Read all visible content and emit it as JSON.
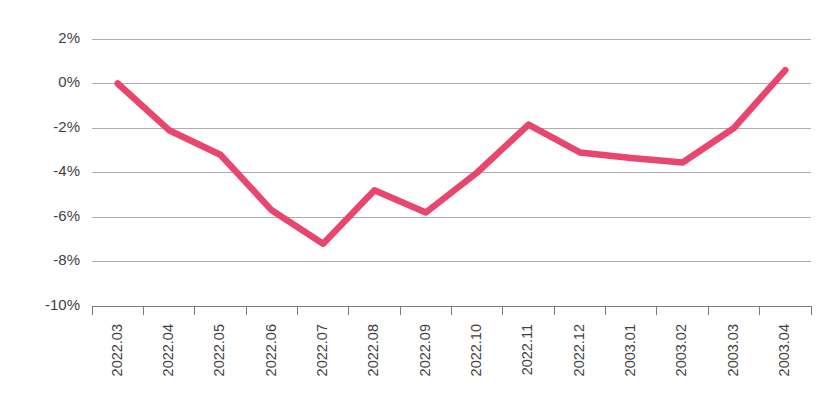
{
  "chart_data": {
    "type": "line",
    "title": "",
    "subtitle": "",
    "xlabel": "",
    "ylabel": "",
    "grid": true,
    "legend": false,
    "legend_position": "none",
    "ylim": [
      -10,
      2
    ],
    "ytick_values": [
      2,
      0,
      -2,
      -4,
      -6,
      -8,
      -10
    ],
    "ytick_labels": [
      "2%",
      "0%",
      "-2%",
      "-4%",
      "-6%",
      "-8%",
      "-10%"
    ],
    "categories": [
      "2022.03",
      "2022.04",
      "2022.05",
      "2022.06",
      "2022.07",
      "2022.08",
      "2022.09",
      "2022.10",
      "2022.11",
      "2022.12",
      "2003.01",
      "2003.02",
      "2003.03",
      "2003.04"
    ],
    "series": [
      {
        "name": "series-1",
        "color": "#E8466F",
        "values": [
          0.0,
          -2.1,
          -3.2,
          -5.7,
          -7.2,
          -4.8,
          -5.8,
          -4.0,
          -1.85,
          -3.1,
          -3.35,
          -3.55,
          -2.0,
          0.6
        ]
      }
    ]
  },
  "style": {
    "line_color": "#E8466F",
    "grid_color": "#8c8c8c",
    "axis_color": "#6e6e6e",
    "text_color": "#3f3f3f",
    "background": "#ffffff"
  }
}
